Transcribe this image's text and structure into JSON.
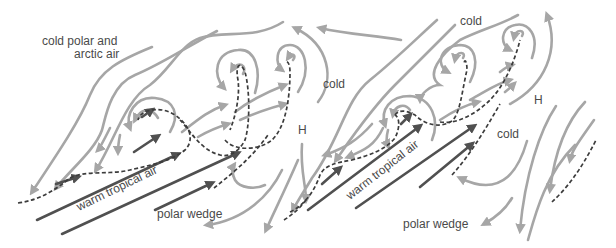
{
  "diagram": {
    "type": "meteorological frontal wave / cyclone family diagram",
    "panels": [
      {
        "id": "left",
        "labels": {
          "air_mass_top": "cold polar and",
          "air_mass_top_line2": "arctic air",
          "cold": "cold",
          "high": "H",
          "warm": "warm tropical air",
          "wedge": "polar wedge"
        }
      },
      {
        "id": "right",
        "labels": {
          "cold_top": "cold",
          "high": "H",
          "cold_mid": "cold",
          "warm": "warm tropical air",
          "wedge": "polar wedge"
        }
      }
    ],
    "legend_semantics": {
      "light_gray_arrows": "cold air flow",
      "dark_arrows": "warm air flow",
      "dashed_lines": "fronts"
    },
    "colors": {
      "cold_flow": "#a6a6a6",
      "warm_flow": "#505050",
      "front": "#3c3c3c",
      "text": "#4a4a4a",
      "background": "#ffffff"
    }
  }
}
